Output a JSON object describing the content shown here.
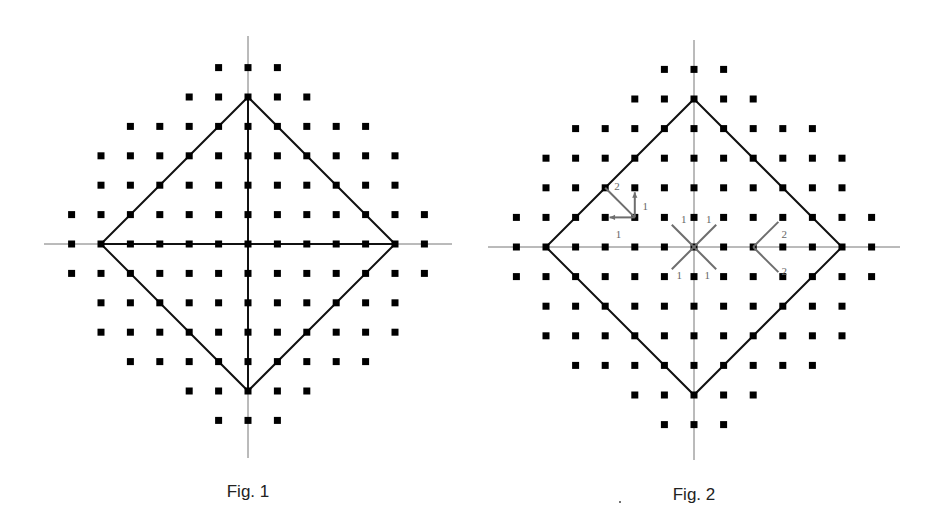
{
  "figures": [
    {
      "id": "fig1",
      "caption": "Fig. 1",
      "caption_pos": [
        248,
        493
      ],
      "origin": [
        248,
        244
      ],
      "spacing": 29.4,
      "axis": {
        "x_from": 44,
        "x_to": 452,
        "y_from": 36,
        "y_to": 458
      },
      "rows": [
        {
          "dy": -6,
          "min": -1,
          "max": 1
        },
        {
          "dy": -5,
          "min": -2,
          "max": 2
        },
        {
          "dy": -4,
          "min": -4,
          "max": 4
        },
        {
          "dy": -3,
          "min": -5,
          "max": 5
        },
        {
          "dy": -2,
          "min": -5,
          "max": 5
        },
        {
          "dy": -1,
          "min": -6,
          "max": 6
        },
        {
          "dy": 0,
          "min": -6,
          "max": 6
        },
        {
          "dy": 1,
          "min": -6,
          "max": 6
        },
        {
          "dy": 2,
          "min": -5,
          "max": 5
        },
        {
          "dy": 3,
          "min": -5,
          "max": 5
        },
        {
          "dy": 4,
          "min": -4,
          "max": 4
        },
        {
          "dy": 5,
          "min": -2,
          "max": 2
        },
        {
          "dy": 6,
          "min": -1,
          "max": 1
        }
      ],
      "diamond_radius": 5,
      "inner_cross": true,
      "arrows": [],
      "labels": []
    },
    {
      "id": "fig2",
      "caption": "Fig. 2",
      "caption_pos": [
        694,
        496
      ],
      "origin": [
        694,
        247
      ],
      "spacing": 29.6,
      "axis": {
        "x_from": 488,
        "x_to": 900,
        "y_from": 40,
        "y_to": 460
      },
      "rows": [
        {
          "dy": -6,
          "min": -1,
          "max": 1
        },
        {
          "dy": -5,
          "min": -2,
          "max": 2
        },
        {
          "dy": -4,
          "min": -4,
          "max": 4
        },
        {
          "dy": -3,
          "min": -5,
          "max": 5
        },
        {
          "dy": -2,
          "min": -5,
          "max": 5
        },
        {
          "dy": -1,
          "min": -6,
          "max": 6
        },
        {
          "dy": 0,
          "min": -6,
          "max": 6
        },
        {
          "dy": 1,
          "min": -6,
          "max": 6
        },
        {
          "dy": 2,
          "min": -5,
          "max": 5
        },
        {
          "dy": 3,
          "min": -5,
          "max": 5
        },
        {
          "dy": 4,
          "min": -4,
          "max": 4
        },
        {
          "dy": 5,
          "min": -2,
          "max": 2
        },
        {
          "dy": 6,
          "min": -1,
          "max": 1
        }
      ],
      "diamond_radius": 5,
      "inner_cross": false,
      "arrows": [
        {
          "from": [
            -2,
            -1
          ],
          "to": [
            -2,
            -1.85
          ],
          "head": true
        },
        {
          "from": [
            -2,
            -1
          ],
          "to": [
            -2.85,
            -1
          ],
          "head": true
        },
        {
          "from": [
            -2,
            -1
          ],
          "to": [
            -3,
            -2
          ],
          "head": false
        },
        {
          "from": [
            0,
            0
          ],
          "to": [
            0.75,
            -0.75
          ],
          "head": false
        },
        {
          "from": [
            0,
            0
          ],
          "to": [
            -0.75,
            -0.75
          ],
          "head": false
        },
        {
          "from": [
            0,
            0
          ],
          "to": [
            0.75,
            0.75
          ],
          "head": false
        },
        {
          "from": [
            0,
            0
          ],
          "to": [
            -0.75,
            0.75
          ],
          "head": false
        },
        {
          "from": [
            2,
            0
          ],
          "to": [
            2.85,
            -0.85
          ],
          "head": false
        },
        {
          "from": [
            2,
            0
          ],
          "to": [
            2.85,
            0.85
          ],
          "head": false
        }
      ],
      "labels": [
        {
          "text": "2",
          "at": [
            -2.6,
            -2.05
          ]
        },
        {
          "text": "1",
          "at": [
            -1.65,
            -1.4
          ]
        },
        {
          "text": "1",
          "at": [
            -2.55,
            -0.45
          ]
        },
        {
          "text": "1",
          "at": [
            -0.35,
            -0.95
          ]
        },
        {
          "text": "1",
          "at": [
            0.5,
            -0.95
          ]
        },
        {
          "text": "1",
          "at": [
            -0.5,
            0.95
          ]
        },
        {
          "text": "1",
          "at": [
            0.45,
            0.95
          ]
        },
        {
          "text": "2",
          "at": [
            3.05,
            -0.45
          ]
        },
        {
          "text": "2",
          "at": [
            3.05,
            0.8
          ]
        }
      ]
    }
  ],
  "stray_dot": [
    620,
    502
  ],
  "colors": {
    "point": "#000000",
    "diamond": "#111111",
    "axis": "#777777",
    "arrow": "#6e6e6e"
  }
}
